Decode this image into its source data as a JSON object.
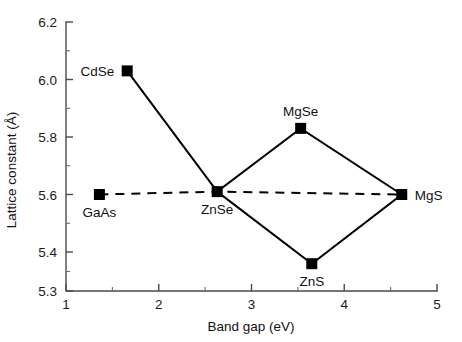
{
  "chart_data": {
    "type": "scatter",
    "title": "",
    "xlabel": "Band gap (eV)",
    "ylabel": "Lattice constant (Å)",
    "xlim": [
      1,
      5
    ],
    "ylim": [
      5.3,
      6.2
    ],
    "grid": false,
    "legend_position": "none",
    "x_ticks": [
      "1",
      "2",
      "3",
      "4",
      "5"
    ],
    "x_tick_values": [
      1,
      2,
      3,
      4,
      5
    ],
    "x_minor_tick_values": [
      1.5,
      2.5,
      3.5,
      4.5
    ],
    "y_ticks": [
      "6.2",
      "6.0",
      "5.8",
      "5.6",
      "5.4",
      "5.3"
    ],
    "y_tick_values": [
      6.2,
      6.0,
      5.8,
      5.6,
      5.4,
      5.3
    ],
    "y_minor_tick_values": [
      6.1,
      5.9,
      5.7,
      5.5,
      5.35
    ],
    "points": [
      {
        "name": "CdSe",
        "x": 1.66,
        "y": 6.03,
        "label": "CdSe",
        "label_pos": "left"
      },
      {
        "name": "GaAs",
        "x": 1.36,
        "y": 5.6,
        "label": "GaAs",
        "label_pos": "below"
      },
      {
        "name": "ZnSe",
        "x": 2.63,
        "y": 5.61,
        "label": "ZnSe",
        "label_pos": "below"
      },
      {
        "name": "MgSe",
        "x": 3.53,
        "y": 5.83,
        "label": "MgSe",
        "label_pos": "above"
      },
      {
        "name": "ZnS",
        "x": 3.65,
        "y": 5.37,
        "label": "ZnS",
        "label_pos": "below"
      },
      {
        "name": "MgS",
        "x": 4.62,
        "y": 5.6,
        "label": "MgS",
        "label_pos": "right"
      }
    ],
    "series": [
      {
        "name": "solid-connections",
        "style": "solid",
        "path": [
          "CdSe",
          "ZnSe",
          "MgSe",
          "MgS",
          "ZnS",
          "ZnSe"
        ]
      },
      {
        "name": "lattice-match-guide",
        "style": "dashed",
        "path": [
          "GaAs",
          "ZnSe",
          "MgS"
        ]
      }
    ]
  }
}
